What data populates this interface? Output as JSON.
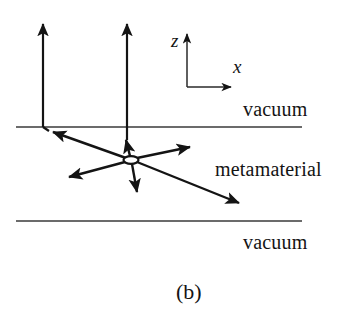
{
  "figure": {
    "caption": "(b)",
    "regions": {
      "top": "vacuum",
      "middle": "metamaterial",
      "bottom": "vacuum"
    },
    "axes": {
      "z_label": "z",
      "x_label": "x",
      "origin": [
        187,
        87
      ],
      "z_tip": [
        187,
        31
      ],
      "x_tip": [
        234,
        87
      ]
    },
    "interfaces": [
      {
        "name": "upper-interface",
        "x1": 16,
        "y1": 127,
        "x2": 302,
        "y2": 127
      },
      {
        "name": "lower-interface",
        "x1": 16,
        "y1": 221,
        "x2": 302,
        "y2": 221
      }
    ],
    "node": {
      "cx": 131,
      "cy": 160,
      "rx": 7,
      "ry": 3.5
    },
    "rays": [
      {
        "name": "incident-upward-left",
        "x1": 43,
        "y1": 127,
        "x2": 43,
        "y2": 20,
        "arrow": "end"
      },
      {
        "name": "interface-segment-left",
        "x1": 43,
        "y1": 127,
        "x2": 48,
        "y2": 131,
        "arrow": "none"
      },
      {
        "name": "transmitted-upward-mid",
        "x1": 127,
        "y1": 148,
        "x2": 127,
        "y2": 20,
        "arrow": "end"
      },
      {
        "name": "node-to-upper-left",
        "x1": 131,
        "y1": 160,
        "x2": 50,
        "y2": 131,
        "arrow": "end"
      },
      {
        "name": "node-to-upper-mid",
        "x1": 131,
        "y1": 160,
        "x2": 126,
        "y2": 137,
        "arrow": "end"
      },
      {
        "name": "node-to-upper-right",
        "x1": 131,
        "y1": 160,
        "x2": 193,
        "y2": 146,
        "arrow": "end"
      },
      {
        "name": "node-to-lower-left",
        "x1": 131,
        "y1": 160,
        "x2": 65,
        "y2": 178,
        "arrow": "end"
      },
      {
        "name": "node-to-lower-mid",
        "x1": 131,
        "y1": 160,
        "x2": 138,
        "y2": 196,
        "arrow": "end"
      },
      {
        "name": "node-to-lower-right",
        "x1": 131,
        "y1": 160,
        "x2": 243,
        "y2": 205,
        "arrow": "end"
      }
    ],
    "colors": {
      "ink": "#141414",
      "line": "#3a3a3a",
      "background": "#ffffff"
    }
  }
}
